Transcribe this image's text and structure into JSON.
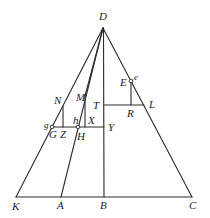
{
  "diagram": {
    "stroke_color": "#2a2a2a",
    "background": "#ffffff",
    "points": {
      "D": {
        "x": 103,
        "y": 28
      },
      "K": {
        "x": 16,
        "y": 197
      },
      "A": {
        "x": 61,
        "y": 197
      },
      "B": {
        "x": 104,
        "y": 197
      },
      "C": {
        "x": 192,
        "y": 197
      },
      "T": {
        "x": 104,
        "y": 105
      },
      "L": {
        "x": 144,
        "y": 105
      },
      "R": {
        "x": 131,
        "y": 105
      },
      "E": {
        "x": 131,
        "y": 81
      },
      "G": {
        "x": 52,
        "y": 127
      },
      "H": {
        "x": 78,
        "y": 127
      },
      "Y": {
        "x": 104,
        "y": 127
      },
      "Z": {
        "x": 63,
        "y": 127
      },
      "N": {
        "x": 63,
        "y": 106
      },
      "M": {
        "x": 85,
        "y": 96
      },
      "X": {
        "x": 85,
        "y": 127
      }
    },
    "labels": [
      {
        "id": "D",
        "text": "D",
        "x": 99,
        "y": 20
      },
      {
        "id": "E",
        "text": "E",
        "x": 120,
        "y": 86
      },
      {
        "id": "e",
        "text": "e",
        "x": 135,
        "y": 80,
        "small": true
      },
      {
        "id": "N",
        "text": "N",
        "x": 55,
        "y": 104
      },
      {
        "id": "M",
        "text": "M",
        "x": 77,
        "y": 101
      },
      {
        "id": "T",
        "text": "T",
        "x": 93,
        "y": 109
      },
      {
        "id": "L",
        "text": "L",
        "x": 149,
        "y": 107
      },
      {
        "id": "R",
        "text": "R",
        "x": 127,
        "y": 117
      },
      {
        "id": "h",
        "text": "h",
        "x": 73,
        "y": 124
      },
      {
        "id": "X",
        "text": "X",
        "x": 88,
        "y": 124
      },
      {
        "id": "g",
        "text": "g",
        "x": 44,
        "y": 128,
        "small": true
      },
      {
        "id": "G",
        "text": "G",
        "x": 50,
        "y": 138
      },
      {
        "id": "Z",
        "text": "Z",
        "x": 60,
        "y": 138
      },
      {
        "id": "H",
        "text": "H",
        "x": 77,
        "y": 140
      },
      {
        "id": "Y",
        "text": "Y",
        "x": 108,
        "y": 131
      },
      {
        "id": "K",
        "text": "K",
        "x": 12,
        "y": 210
      },
      {
        "id": "A",
        "text": "A",
        "x": 57,
        "y": 209
      },
      {
        "id": "B",
        "text": "B",
        "x": 100,
        "y": 209
      },
      {
        "id": "C",
        "text": "C",
        "x": 190,
        "y": 209
      }
    ]
  }
}
